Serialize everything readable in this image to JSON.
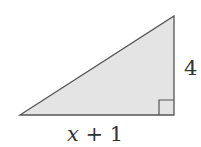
{
  "diagram": {
    "type": "right-triangle",
    "fill_color": "#e4e4e4",
    "stroke_color": "#555555",
    "vertices": {
      "left": [
        20,
        115
      ],
      "top": [
        174,
        16
      ],
      "right_angle": [
        174,
        115
      ]
    },
    "right_angle_marker_size": 15,
    "labels": {
      "vertical_side": "4",
      "base_variable": "x",
      "base_rest": " + 1"
    }
  }
}
